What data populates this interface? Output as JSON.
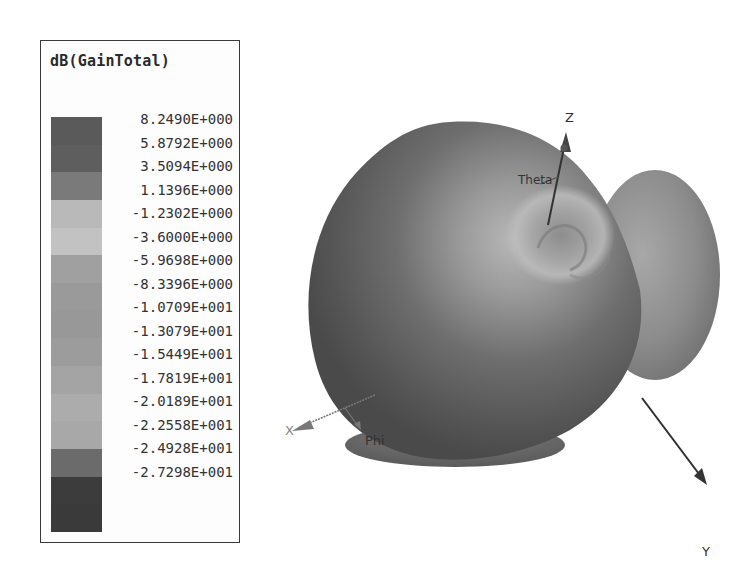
{
  "chart_data": {
    "type": "3d-radiation-pattern",
    "title": "dB(GainTotal)",
    "colorbar": {
      "title": "dB(GainTotal)",
      "ticks": [
        "8.2490E+000",
        "5.8792E+000",
        "3.5094E+000",
        "1.1396E+000",
        "-1.2302E+000",
        "-3.6000E+000",
        "-5.9698E+000",
        "-8.3396E+000",
        "-1.0709E+001",
        "-1.3079E+001",
        "-1.5449E+001",
        "-1.7819E+001",
        "-2.0189E+001",
        "-2.2558E+001",
        "-2.4928E+001",
        "-2.7298E+001"
      ],
      "values": [
        8.249,
        5.8792,
        3.5094,
        1.1396,
        -1.2302,
        -3.6,
        -5.9698,
        -8.3396,
        -10.709,
        -13.079,
        -15.449,
        -17.819,
        -20.189,
        -22.558,
        -24.928,
        -27.298
      ],
      "range": [
        -27.298,
        8.249
      ],
      "unit": "dB",
      "swatch_colors": [
        "#5a5a5a",
        "#5e5e5e",
        "#7a7a7a",
        "#b9b9b9",
        "#c2c2c2",
        "#a0a0a0",
        "#9a9a9a",
        "#989898",
        "#9c9c9c",
        "#a4a4a4",
        "#acacac",
        "#a8a8a8",
        "#6b6b6b",
        "#3c3c3c",
        "#3a3a3a"
      ]
    },
    "axes": {
      "x": "X",
      "y": "Y",
      "z": "Z",
      "angle_labels": [
        "Theta",
        "Phi"
      ]
    },
    "legend_position": "left"
  },
  "legend": {
    "title": "dB(GainTotal)"
  },
  "axis_labels": {
    "z": "Z",
    "y": "Y",
    "x": "X",
    "theta": "Theta",
    "phi": "Phi"
  }
}
